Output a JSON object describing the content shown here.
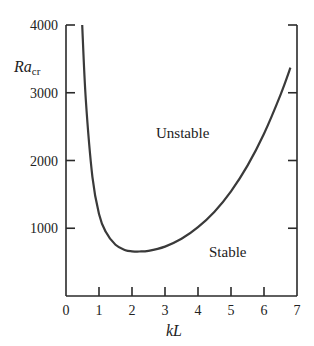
{
  "chart_data": {
    "type": "line",
    "title": "",
    "xlabel": "kL",
    "ylabel": "Ra",
    "ylabel_subscript": "cr",
    "xlim": [
      0,
      7
    ],
    "ylim": [
      0,
      4000
    ],
    "x_ticks": [
      0,
      1,
      2,
      3,
      4,
      5,
      6,
      7
    ],
    "x_tick_labels": [
      "0",
      "1",
      "2",
      "3",
      "4",
      "5",
      "6",
      "7"
    ],
    "y_ticks": [
      1000,
      2000,
      3000,
      4000
    ],
    "y_tick_labels": [
      "1000",
      "2000",
      "3000",
      "4000"
    ],
    "grid": false,
    "series": [
      {
        "name": "Critical Rayleigh number curve",
        "x": [
          0.49,
          0.6,
          0.8,
          1.0,
          1.2,
          1.5,
          1.8,
          2.0,
          2.22,
          2.5,
          3.0,
          3.5,
          4.0,
          4.5,
          5.0,
          5.5,
          6.0,
          6.5,
          6.8
        ],
        "values": [
          4000,
          2900,
          1760,
          1210,
          950,
          755,
          676,
          660,
          657,
          667,
          729,
          845,
          1015,
          1245,
          1545,
          1925,
          2395,
          2970,
          3370
        ]
      }
    ],
    "annotations": [
      {
        "text": "Unstable",
        "x": 3.0,
        "y": 2900
      },
      {
        "text": "Stable",
        "x": 5.3,
        "y": 700
      }
    ],
    "minimum": {
      "x": 2.22,
      "y": 657
    }
  },
  "labels": {
    "unstable": "Unstable",
    "stable": "Stable",
    "xlabel": "kL",
    "ylabel_main": "Ra",
    "ylabel_sub": "cr"
  }
}
